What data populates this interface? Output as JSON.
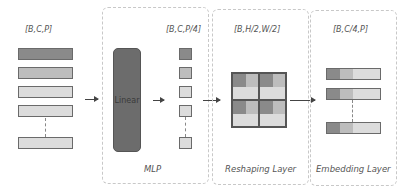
{
  "colors": {
    "dark": "#8a8a8a",
    "medium": "#bdbdbd",
    "light": "#dcdcdc",
    "lighter": "#e6e6e6",
    "linear": "#6c6c6c"
  },
  "input": {
    "label": "[B,C,P]",
    "bar_colors": [
      "#8a8a8a",
      "#bdbdbd",
      "#dcdcdc",
      "#dcdcdc",
      "#dcdcdc"
    ]
  },
  "mlp": {
    "title": "MLP",
    "linear_label": "Linear",
    "output_label": "[B,C,P/4]",
    "square_colors": [
      "#8a8a8a",
      "#bdbdbd",
      "#dcdcdc",
      "#dcdcdc",
      "#dcdcdc"
    ]
  },
  "reshaping": {
    "title": "Reshaping Layer",
    "output_label": "[B,H/2,W/2]",
    "quadrant_cells": [
      "#8a8a8a",
      "#bdbdbd",
      "#dcdcdc",
      "#dcdcdc"
    ]
  },
  "embedding": {
    "title": "Embedding Layer",
    "output_label": "[B,C/4,P]",
    "bar_segments": [
      "#8a8a8a",
      "#bdbdbd",
      "#dcdcdc"
    ]
  }
}
